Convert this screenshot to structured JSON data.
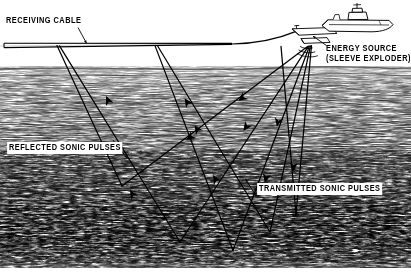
{
  "figure": {
    "width": 411,
    "height": 279,
    "background_color": "#ffffff",
    "ink_color": "#000000"
  },
  "labels": {
    "receiving_cable": "RECEIVING  CABLE",
    "energy_source_line1": "ENERGY  SOURCE",
    "energy_source_line2": "(SLEEVE  EXPLODER)",
    "reflected_pulses": "REFLECTED  SONIC  PULSES",
    "transmitted_pulses": "TRANSMITTED  SONIC  PULSES"
  },
  "icons": {
    "survey_ship": "ship-icon",
    "towed_float": "towed-float-icon",
    "sound_burst": "sound-wave-icon",
    "ray_arrowhead": "arrowhead-icon",
    "leader_line": "leader-line-icon"
  },
  "scene": {
    "sea_surface_y": 46,
    "seabed_top_y": 66,
    "strata_bottom_y": 268,
    "energy_source": {
      "x": 308,
      "y": 46
    },
    "ship": {
      "x": 352,
      "y": 22
    },
    "towed_float": {
      "x": 300,
      "y": 33
    },
    "cable": {
      "left_end_x": 4,
      "left_end_y": 46,
      "taper_point_x": 232,
      "taper_point_y": 44,
      "curve_to_x": 296,
      "curve_to_y": 31
    },
    "receiver_points": [
      {
        "x": 57,
        "y": 45
      },
      {
        "x": 155,
        "y": 45
      }
    ],
    "reflection_points": [
      {
        "x": 122,
        "y": 186
      },
      {
        "x": 180,
        "y": 242
      },
      {
        "x": 233,
        "y": 250
      },
      {
        "x": 270,
        "y": 232
      },
      {
        "x": 296,
        "y": 214
      }
    ]
  },
  "leader_lines": {
    "receiving_cable": {
      "from_x": 78,
      "from_y": 28,
      "to_x": 86,
      "to_y": 44
    },
    "energy_source": {
      "from_x": 326,
      "from_y": 46,
      "to_x": 312,
      "to_y": 36
    },
    "reflected_pulses": {
      "from_x": 113,
      "from_y": 140,
      "to_x": 126,
      "to_y": 157
    },
    "transmitted_pulses": {
      "from_x": 256,
      "from_y": 196,
      "to_x": 245,
      "to_y": 180
    }
  }
}
